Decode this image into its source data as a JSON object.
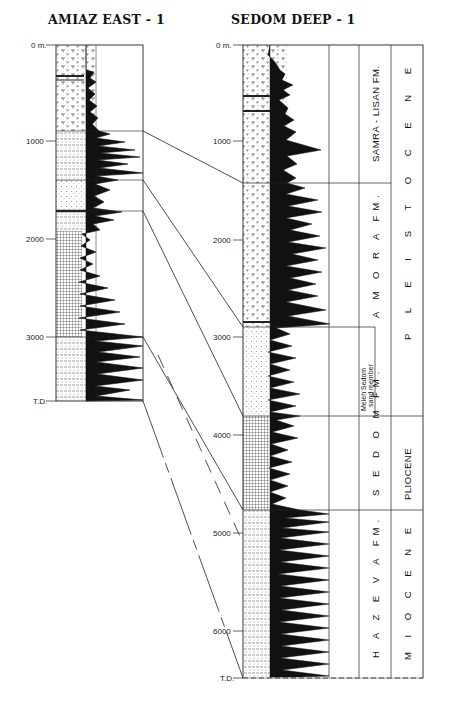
{
  "wells": [
    {
      "name": "AMIAZ EAST - 1",
      "depth_ticks": [
        {
          "label": "0 m.",
          "y": 45
        },
        {
          "label": "1000",
          "y": 141
        },
        {
          "label": "2000",
          "y": 239
        },
        {
          "label": "3000",
          "y": 337
        },
        {
          "label": "T.D.",
          "y": 401
        }
      ]
    },
    {
      "name": "SEDOM DEEP - 1",
      "depth_ticks": [
        {
          "label": "0 m.",
          "y": 45
        },
        {
          "label": "1000",
          "y": 141
        },
        {
          "label": "2000",
          "y": 240
        },
        {
          "label": "3000",
          "y": 337
        },
        {
          "label": "4000",
          "y": 435
        },
        {
          "label": "5000",
          "y": 533
        },
        {
          "label": "6000",
          "y": 631
        },
        {
          "label": "T.D.",
          "y": 678
        }
      ],
      "formations": [
        {
          "label": "SAMRA - LISAN FM.",
          "top": 45,
          "bottom": 183
        },
        {
          "label": "A M O R A   FM.",
          "top": 183,
          "bottom": 416
        },
        {
          "label": "S E D O M   FM.",
          "top": 416,
          "bottom": 510
        },
        {
          "label": "H A Z E V A   FM.",
          "top": 510,
          "bottom": 678
        }
      ],
      "member": {
        "line1": "Meleh Sedom",
        "line2": "sand member",
        "top": 327,
        "bottom": 416
      },
      "epochs": [
        {
          "label": "P L E I S T O C E N E",
          "top": 45,
          "bottom": 416
        },
        {
          "label": "PLIOCENE",
          "top": 416,
          "bottom": 510
        },
        {
          "label": "M I O C E N E",
          "top": 510,
          "bottom": 678
        }
      ]
    }
  ],
  "correlation_lines": [
    {
      "from": [
        143,
        131
      ],
      "to": [
        243,
        183
      ],
      "style": "solid"
    },
    {
      "from": [
        143,
        180
      ],
      "to": [
        243,
        327
      ],
      "style": "solid"
    },
    {
      "from": [
        143,
        211
      ],
      "to": [
        243,
        416
      ],
      "style": "solid"
    },
    {
      "from": [
        143,
        337
      ],
      "to": [
        243,
        510
      ],
      "style": "solid"
    },
    {
      "from": [
        158,
        355
      ],
      "to": [
        243,
        543
      ],
      "style": "dashed"
    },
    {
      "from": [
        143,
        401
      ],
      "to": [
        243,
        678
      ],
      "style": "dashed-long"
    }
  ]
}
